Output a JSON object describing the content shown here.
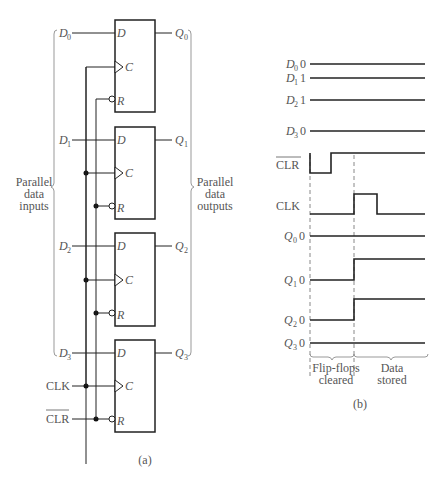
{
  "figure_a": {
    "caption": "(a)",
    "inputs_group_label": [
      "Parallel",
      "data",
      "inputs"
    ],
    "outputs_group_label": [
      "Parallel",
      "data",
      "outputs"
    ],
    "flip_flops": [
      {
        "d_in": "D",
        "d_sub": "0",
        "q_out": "Q",
        "q_sub": "0",
        "pin_d": "D",
        "pin_c": "C",
        "pin_r": "R"
      },
      {
        "d_in": "D",
        "d_sub": "1",
        "q_out": "Q",
        "q_sub": "1",
        "pin_d": "D",
        "pin_c": "C",
        "pin_r": "R"
      },
      {
        "d_in": "D",
        "d_sub": "2",
        "q_out": "Q",
        "q_sub": "2",
        "pin_d": "D",
        "pin_c": "C",
        "pin_r": "R"
      },
      {
        "d_in": "D",
        "d_sub": "3",
        "q_out": "Q",
        "q_sub": "3",
        "pin_d": "D",
        "pin_c": "C",
        "pin_r": "R"
      }
    ],
    "clk_label": "CLK",
    "clr_label": "CLR"
  },
  "figure_b": {
    "caption": "(b)",
    "signals": [
      {
        "name": "D",
        "sub": "0",
        "value": "0"
      },
      {
        "name": "D",
        "sub": "1",
        "value": "1"
      },
      {
        "name": "D",
        "sub": "2",
        "value": "1"
      },
      {
        "name": "D",
        "sub": "3",
        "value": "0"
      },
      {
        "name": "CLR",
        "overbar": true
      },
      {
        "name": "CLK"
      },
      {
        "name": "Q",
        "sub": "0",
        "value": "0"
      },
      {
        "name": "Q",
        "sub": "1",
        "value": "0"
      },
      {
        "name": "Q",
        "sub": "2",
        "value": "0"
      },
      {
        "name": "Q",
        "sub": "3",
        "value": "0"
      }
    ],
    "phase_labels": [
      [
        "Flip-flops",
        "cleared"
      ],
      [
        "Data",
        "stored"
      ]
    ]
  }
}
